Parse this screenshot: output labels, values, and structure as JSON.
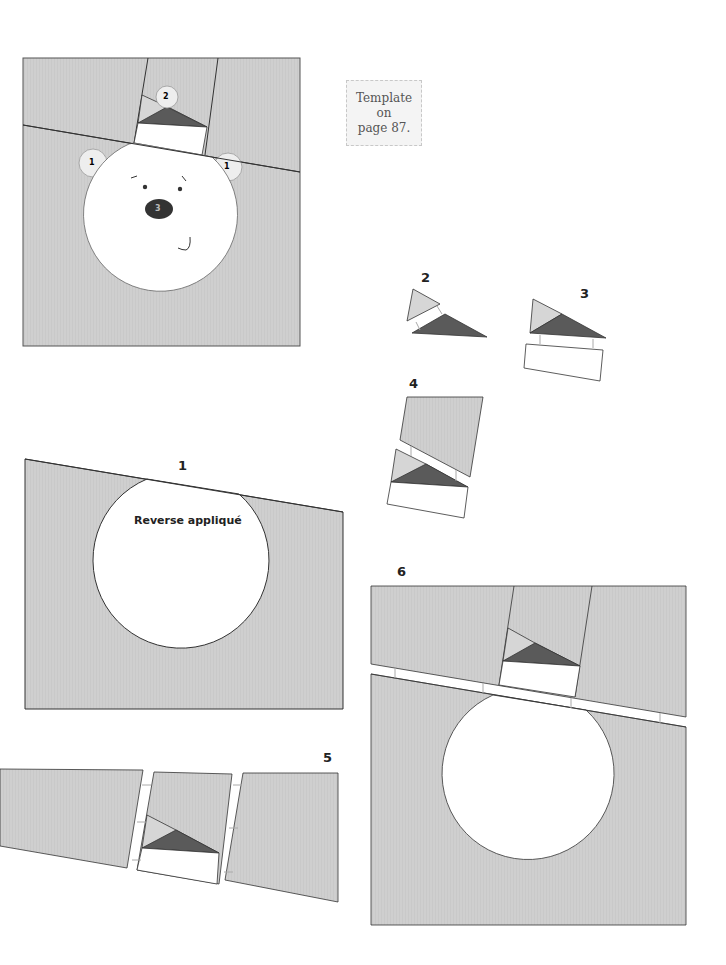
{
  "template_note": {
    "line1": "Template on",
    "line2": "page 87."
  },
  "finished_block": {
    "ear_labels": [
      "1",
      "1"
    ],
    "hat_label": "2",
    "nose_label": "3"
  },
  "steps": [
    {
      "number": "1",
      "annotation": "Reverse appliqué"
    },
    {
      "number": "2"
    },
    {
      "number": "3"
    },
    {
      "number": "4"
    },
    {
      "number": "5"
    },
    {
      "number": "6"
    }
  ],
  "colors": {
    "background_fabric": "#cfcfcf",
    "light_triangle": "#d6d6d6",
    "dark_triangle": "#5a5a5a",
    "white": "#ffffff",
    "outline": "#333333",
    "nose": "#333333"
  }
}
